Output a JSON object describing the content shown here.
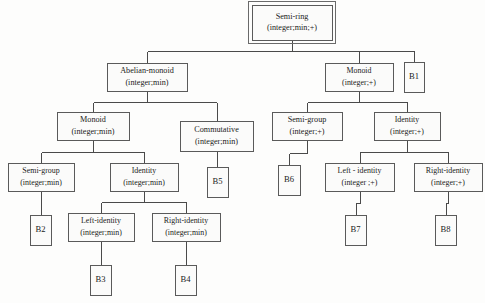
{
  "diagram": {
    "type": "tree",
    "colors": {
      "background": "#fdfdfc",
      "box_fill": "#fbfbfa",
      "box_stroke": "#5a5a5a",
      "edge_stroke": "#4a4a4a",
      "text": "#1b1b1b"
    },
    "nodes": [
      {
        "id": "semi-ring",
        "line1": "Semi-ring",
        "line2": "(integer;min;+)",
        "x": 252,
        "y": 5,
        "w": 80,
        "h": 35,
        "double_border": true,
        "root": true
      },
      {
        "id": "abelian-monoid",
        "line1": "Abelian-monoid",
        "line2": "(integer;min)",
        "x": 107,
        "y": 63,
        "w": 80,
        "h": 28,
        "double_border": false
      },
      {
        "id": "monoid-plus",
        "line1": "Monoid",
        "line2": "(integer;+)",
        "x": 325,
        "y": 63,
        "w": 68,
        "h": 28,
        "double_border": false
      },
      {
        "id": "b1",
        "line1": "B1",
        "line2": "",
        "x": 404,
        "y": 62,
        "w": 20,
        "h": 30,
        "double_border": false,
        "leaf": true
      },
      {
        "id": "monoid-min",
        "line1": "Monoid",
        "line2": "(integer;min)",
        "x": 57,
        "y": 112,
        "w": 72,
        "h": 28,
        "double_border": false
      },
      {
        "id": "commutative",
        "line1": "Commutative",
        "line2": "(integer;min)",
        "x": 180,
        "y": 121,
        "w": 73,
        "h": 30,
        "double_border": false
      },
      {
        "id": "semi-group-plus",
        "line1": "Semi-group",
        "line2": "(integer;+)",
        "x": 272,
        "y": 112,
        "w": 70,
        "h": 28,
        "double_border": false
      },
      {
        "id": "identity-plus",
        "line1": "Identity",
        "line2": "(integer;+)",
        "x": 374,
        "y": 112,
        "w": 66,
        "h": 28,
        "double_border": false
      },
      {
        "id": "semi-group-min",
        "line1": "Semi-group",
        "line2": "(integer;min)",
        "x": 8,
        "y": 163,
        "w": 66,
        "h": 28,
        "double_border": false
      },
      {
        "id": "identity-min",
        "line1": "Identity",
        "line2": "(integer;min)",
        "x": 110,
        "y": 163,
        "w": 68,
        "h": 28,
        "double_border": false
      },
      {
        "id": "b5",
        "line1": "B5",
        "line2": "",
        "x": 207,
        "y": 167,
        "w": 21,
        "h": 30,
        "double_border": false,
        "leaf": true
      },
      {
        "id": "b6",
        "line1": "B6",
        "line2": "",
        "x": 278,
        "y": 165,
        "w": 22,
        "h": 30,
        "double_border": false,
        "leaf": true
      },
      {
        "id": "left-identity-plus",
        "line1": "Left - identity",
        "line2": "(integer ;+)",
        "x": 325,
        "y": 163,
        "w": 69,
        "h": 28,
        "double_border": false
      },
      {
        "id": "right-identity-plus",
        "line1": "Right-identity",
        "line2": "(integer;+)",
        "x": 414,
        "y": 163,
        "w": 68,
        "h": 28,
        "double_border": false
      },
      {
        "id": "b2",
        "line1": "B2",
        "line2": "",
        "x": 30,
        "y": 215,
        "w": 21,
        "h": 30,
        "double_border": false,
        "leaf": true
      },
      {
        "id": "left-identity-min",
        "line1": "Left-identity",
        "line2": "(integer;min)",
        "x": 68,
        "y": 213,
        "w": 66,
        "h": 28,
        "double_border": false
      },
      {
        "id": "right-identity-min",
        "line1": "Right-identity",
        "line2": "(integer;min)",
        "x": 152,
        "y": 213,
        "w": 68,
        "h": 28,
        "double_border": false
      },
      {
        "id": "b7",
        "line1": "B7",
        "line2": "",
        "x": 345,
        "y": 215,
        "w": 21,
        "h": 30,
        "double_border": false,
        "leaf": true
      },
      {
        "id": "b8",
        "line1": "B8",
        "line2": "",
        "x": 435,
        "y": 215,
        "w": 21,
        "h": 30,
        "double_border": false,
        "leaf": true
      },
      {
        "id": "b3",
        "line1": "B3",
        "line2": "",
        "x": 90,
        "y": 265,
        "w": 21,
        "h": 30,
        "double_border": false,
        "leaf": true
      },
      {
        "id": "b4",
        "line1": "B4",
        "line2": "",
        "x": 175,
        "y": 265,
        "w": 21,
        "h": 30,
        "double_border": false,
        "leaf": true
      }
    ],
    "edges": [
      {
        "from": "semi-ring",
        "to": "abelian-monoid",
        "style": "elbow"
      },
      {
        "from": "semi-ring",
        "to": "monoid-plus",
        "style": "elbow"
      },
      {
        "from": "semi-ring",
        "to": "b1",
        "style": "elbow"
      },
      {
        "from": "abelian-monoid",
        "to": "monoid-min",
        "style": "elbow"
      },
      {
        "from": "abelian-monoid",
        "to": "commutative",
        "style": "elbow"
      },
      {
        "from": "monoid-plus",
        "to": "semi-group-plus",
        "style": "elbow"
      },
      {
        "from": "monoid-plus",
        "to": "identity-plus",
        "style": "elbow"
      },
      {
        "from": "monoid-min",
        "to": "semi-group-min",
        "style": "elbow"
      },
      {
        "from": "monoid-min",
        "to": "identity-min",
        "style": "elbow"
      },
      {
        "from": "commutative",
        "to": "b5",
        "style": "straight"
      },
      {
        "from": "semi-group-plus",
        "to": "b6",
        "style": "straight"
      },
      {
        "from": "identity-plus",
        "to": "left-identity-plus",
        "style": "elbow"
      },
      {
        "from": "identity-plus",
        "to": "right-identity-plus",
        "style": "elbow"
      },
      {
        "from": "semi-group-min",
        "to": "b2",
        "style": "straight"
      },
      {
        "from": "identity-min",
        "to": "left-identity-min",
        "style": "elbow"
      },
      {
        "from": "identity-min",
        "to": "right-identity-min",
        "style": "elbow"
      },
      {
        "from": "left-identity-plus",
        "to": "b7",
        "style": "straight"
      },
      {
        "from": "right-identity-plus",
        "to": "b8",
        "style": "straight"
      },
      {
        "from": "left-identity-min",
        "to": "b3",
        "style": "straight"
      },
      {
        "from": "right-identity-min",
        "to": "b4",
        "style": "straight"
      }
    ]
  }
}
